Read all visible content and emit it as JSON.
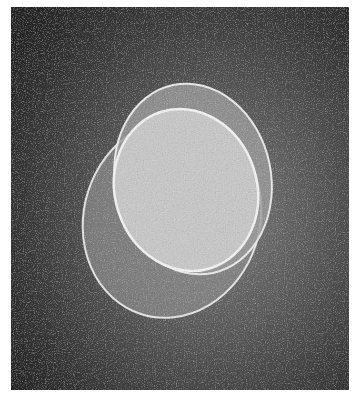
{
  "image": {
    "description": "Grayscale micrograph of three overlapping translucent ellipses on a noisy dark background",
    "colors": {
      "background_dark": "#262626",
      "background_light": "#7a7a7a",
      "outer_ellipse_fill": "#8c8c8c",
      "upper_ellipse_fill": "#9a9a9a",
      "inner_ellipse_fill": "#c4c4c4",
      "edge": "#e6e6e6"
    }
  }
}
